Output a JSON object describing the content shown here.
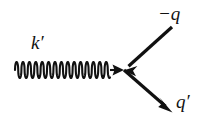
{
  "diagram": {
    "type": "feynman-diagram",
    "background_color": "#ffffff",
    "line_color": "#111111",
    "vertex": {
      "x": 124,
      "y": 70
    },
    "labels": {
      "photon_label": "k′",
      "incoming_label": "−q",
      "outgoing_label": "q′"
    },
    "lines": [
      {
        "name": "photon-wavy-line",
        "style": "wavy",
        "label": "k′",
        "from": {
          "x": 15,
          "y": 70
        },
        "to": {
          "x": 124,
          "y": 70
        },
        "arrow_at": "end",
        "arrow_direction": "right",
        "amplitude": 8,
        "wavelength": 6.4,
        "stroke_width": 2
      },
      {
        "name": "incoming-fermion-line",
        "style": "straight",
        "label": "−q",
        "from": {
          "x": 172,
          "y": 27
        },
        "to": {
          "x": 124,
          "y": 70
        },
        "arrow_at": "end",
        "arrow_direction": "down-left",
        "stroke_width": 3.2
      },
      {
        "name": "outgoing-fermion-line",
        "style": "straight",
        "label": "q′",
        "from": {
          "x": 124,
          "y": 70
        },
        "to": {
          "x": 172,
          "y": 112
        },
        "arrow_at": "end",
        "arrow_direction": "down-right",
        "stroke_width": 3.2
      }
    ]
  }
}
